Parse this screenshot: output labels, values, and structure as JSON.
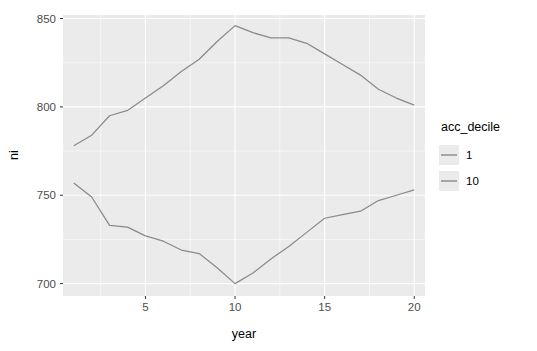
{
  "chart_data": {
    "type": "line",
    "title": "",
    "subtitle": "",
    "xlabel": "year",
    "ylabel": "ni",
    "xlim": [
      0.4,
      20.6
    ],
    "ylim": [
      693,
      852
    ],
    "xticks": [
      5,
      10,
      15,
      20
    ],
    "yticks": [
      700,
      750,
      800,
      850
    ],
    "xtick_labels": [
      "5",
      "10",
      "15",
      "20"
    ],
    "ytick_labels": [
      "700",
      "750",
      "800",
      "850"
    ],
    "grid": true,
    "grid_major_color": "#ffffff",
    "grid_minor_color": "#ffffff",
    "panel_background": "#ebebeb",
    "plot_background": "#ffffff",
    "legend": {
      "title": "acc_decile",
      "position": "right",
      "entries": [
        {
          "label": "1",
          "color": "#8a8a8a"
        },
        {
          "label": "10",
          "color": "#8a8a8a"
        }
      ]
    },
    "x": [
      1,
      2,
      3,
      4,
      5,
      6,
      7,
      8,
      9,
      10,
      11,
      12,
      13,
      14,
      15,
      16,
      17,
      18,
      19,
      20
    ],
    "series": [
      {
        "name": "1",
        "color": "#8a8a8a",
        "values": [
          778,
          784,
          795,
          798,
          805,
          812,
          820,
          827,
          837,
          846,
          842,
          839,
          839,
          836,
          830,
          824,
          818,
          810,
          805,
          801
        ]
      },
      {
        "name": "10",
        "color": "#8a8a8a",
        "values": [
          757,
          749,
          733,
          732,
          727,
          724,
          719,
          717,
          709,
          700,
          706,
          714,
          721,
          729,
          737,
          739,
          741,
          747,
          750,
          753
        ]
      }
    ],
    "annotations": []
  }
}
